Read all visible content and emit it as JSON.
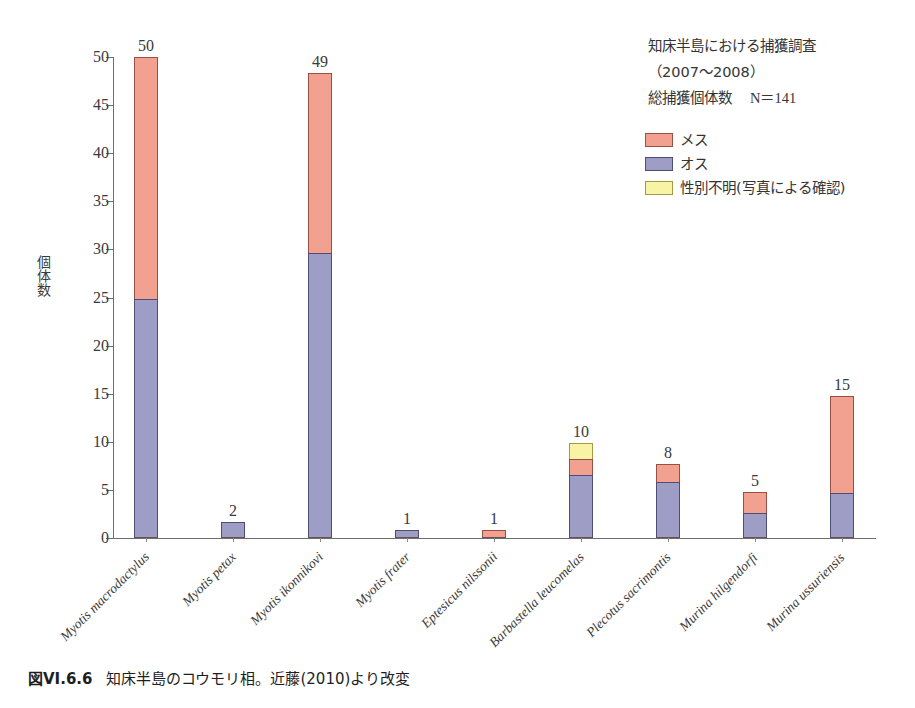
{
  "chart_data": {
    "type": "bar",
    "stacked": true,
    "title": "",
    "xlabel": "",
    "ylabel": "個体数",
    "ylim": [
      0,
      50
    ],
    "yticks": [
      0,
      5,
      10,
      15,
      20,
      25,
      30,
      35,
      40,
      45,
      50
    ],
    "grid": false,
    "legend_position": "top-right",
    "categories": [
      "Myotis macrodactylus",
      "Myotis petax",
      "Myotis ikonnikovi",
      "Myotis frater",
      "Eptesicus nilssonii",
      "Barbastella leucomelas",
      "Plecotus sacrimontis",
      "Murina hilgendorfi",
      "Murina ussuriensis"
    ],
    "series": [
      {
        "name": "オス",
        "color": "#9d9dc6",
        "values": [
          24.8,
          1.7,
          29.6,
          0.8,
          0,
          6.6,
          5.8,
          2.6,
          4.7
        ]
      },
      {
        "name": "メス",
        "color": "#f2a191",
        "values": [
          25.2,
          0,
          18.7,
          0,
          0.8,
          1.6,
          1.9,
          2.2,
          10.1
        ]
      },
      {
        "name": "性別不明(写真による確認)",
        "color": "#f7f4a6",
        "values": [
          0,
          0,
          0,
          0,
          0,
          1.7,
          0,
          0,
          0
        ]
      }
    ],
    "bar_labels": [
      "50",
      "2",
      "49",
      "1",
      "1",
      "10",
      "8",
      "5",
      "15"
    ],
    "annotations": [
      "知床半島における捕獲調査",
      "（2007〜2008）",
      "総捕獲個体数",
      "N＝141"
    ]
  },
  "axis": {
    "y_title": "個体数",
    "y_tick_labels": [
      "0",
      "5",
      "10",
      "15",
      "20",
      "25",
      "30",
      "35",
      "40",
      "45",
      "50"
    ]
  },
  "annotation": {
    "line1": "知床半島における捕獲調査",
    "line2": "（2007〜2008）",
    "line3_label": "総捕獲個体数",
    "line3_value": "N＝141"
  },
  "legend": {
    "items": [
      {
        "label": "メス",
        "color": "#f2a191"
      },
      {
        "label": "オス",
        "color": "#9d9dc6"
      },
      {
        "label": "性別不明(写真による確認)",
        "color": "#f7f4a6"
      }
    ]
  },
  "bars": [
    {
      "species": "Myotis macrodactylus",
      "total_label": "50"
    },
    {
      "species": "Myotis petax",
      "total_label": "2"
    },
    {
      "species": "Myotis ikonnikovi",
      "total_label": "49"
    },
    {
      "species": "Myotis frater",
      "total_label": "1"
    },
    {
      "species": "Eptesicus nilssonii",
      "total_label": "1"
    },
    {
      "species": "Barbastella leucomelas",
      "total_label": "10"
    },
    {
      "species": "Plecotus sacrimontis",
      "total_label": "8"
    },
    {
      "species": "Murina hilgendorfi",
      "total_label": "5"
    },
    {
      "species": "Murina ussuriensis",
      "total_label": "15"
    }
  ],
  "caption": {
    "number": "図VI.6.6",
    "text": "知床半島のコウモリ相。近藤(2010)より改変"
  }
}
